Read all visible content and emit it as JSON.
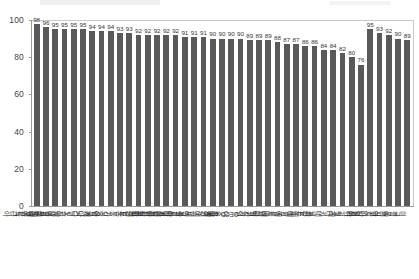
{
  "chart_data": {
    "type": "bar",
    "title": "",
    "subtitle": "",
    "xlabel": "",
    "ylabel": "",
    "ylim": [
      0,
      100
    ],
    "yticks": [
      0,
      20,
      40,
      60,
      80,
      100
    ],
    "grid": false,
    "legend": false,
    "legend_position": "none",
    "bar_color": "#595959",
    "axis_color": "#9a9a9a",
    "label_rotation": 90,
    "categories": [
      "에스토니아",
      "룩셈부르크",
      "슬로베니아",
      "아이슬란드",
      "노르웨이",
      "스위스",
      "캐나다",
      "영국",
      "오스트리아",
      "불가리아",
      "호주",
      "핀란드",
      "뉴질랜드",
      "라트비아",
      "리투아니아",
      "아일랜드",
      "슬로바키아공화국",
      "체코공화국",
      "대한민국",
      "프랑스",
      "스페인",
      "이스라엘",
      "OECD 평균",
      "독일",
      "헝가리",
      "덴마크",
      "루마니아",
      "포르투갈",
      "벨기에",
      "스웨덴",
      "폴란드",
      "네덜란드",
      "터키",
      "칠레",
      "그리스",
      "일본",
      "이탈리아",
      "크로아티아",
      "멕시코",
      "콜롬비아",
      "미국"
    ],
    "values": [
      98,
      96,
      95,
      95,
      95,
      95,
      94,
      94,
      94,
      93,
      93,
      92,
      92,
      92,
      92,
      92,
      91,
      91,
      91,
      90,
      90,
      90,
      90,
      89,
      89,
      89,
      88,
      87,
      87,
      86,
      86,
      84,
      84,
      82,
      80,
      76,
      95,
      93,
      92,
      90,
      89
    ],
    "value_labels": [
      "98",
      "96",
      "95",
      "95",
      "95",
      "95",
      "94",
      "94",
      "94",
      "93",
      "93",
      "92",
      "92",
      "92",
      "92",
      "92",
      "91",
      "91",
      "91",
      "90",
      "90",
      "90",
      "90",
      "89",
      "89",
      "89",
      "88",
      "87",
      "87",
      "86",
      "86",
      "84",
      "84",
      "82",
      "80",
      "76",
      "95",
      "93",
      "92",
      "90",
      "89"
    ]
  },
  "axis": {
    "y_tick_labels": [
      "0",
      "20",
      "40",
      "60",
      "80",
      "100"
    ]
  }
}
